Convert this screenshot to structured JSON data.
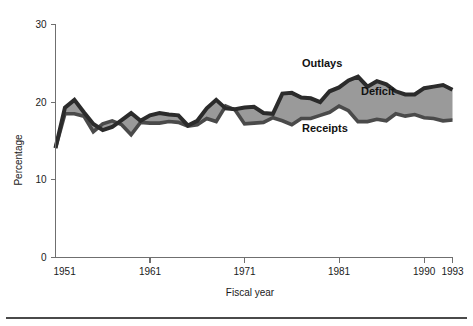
{
  "chart_data": {
    "type": "area",
    "title": "",
    "xlabel": "Fiscal year",
    "ylabel": "Percentage",
    "xlim": [
      1951,
      1993
    ],
    "ylim": [
      0,
      30
    ],
    "yticks": [
      0,
      10,
      20,
      30
    ],
    "ytick_labels": [
      "0",
      "10",
      "20",
      "30"
    ],
    "xticks": [
      1951,
      1961,
      1971,
      1981,
      1990,
      1993
    ],
    "xtick_labels": [
      "1951",
      "1961",
      "1971",
      "1981",
      "1990",
      "1993"
    ],
    "grid": false,
    "legend_position": "inline-annotations",
    "annotations": [
      {
        "text": "Outlays",
        "x": 1978,
        "y": 25.6
      },
      {
        "text": "Deficit",
        "x": 1984,
        "y": 22.0
      },
      {
        "text": "Receipts",
        "x": 1978,
        "y": 16.6
      }
    ],
    "colors": {
      "outlays_line": "#2b2b2b",
      "receipts_line": "#4a4a4a",
      "deficit_fill": "#9a9a9a",
      "axis": "#6f6f6f",
      "text": "#1a1a1a"
    },
    "x": [
      1951,
      1952,
      1953,
      1954,
      1955,
      1956,
      1957,
      1958,
      1959,
      1960,
      1961,
      1962,
      1963,
      1964,
      1965,
      1966,
      1967,
      1968,
      1969,
      1970,
      1971,
      1972,
      1973,
      1974,
      1975,
      1976,
      1977,
      1978,
      1979,
      1980,
      1981,
      1982,
      1983,
      1984,
      1985,
      1986,
      1987,
      1988,
      1989,
      1990,
      1991,
      1992,
      1993
    ],
    "series": [
      {
        "name": "Outlays",
        "values": [
          14.1,
          19.3,
          20.3,
          18.7,
          17.2,
          16.4,
          16.8,
          17.7,
          18.6,
          17.6,
          18.3,
          18.6,
          18.4,
          18.3,
          17.0,
          17.6,
          19.2,
          20.3,
          19.2,
          19.1,
          19.3,
          19.4,
          18.6,
          18.5,
          21.1,
          21.2,
          20.6,
          20.5,
          20.0,
          21.4,
          21.9,
          22.8,
          23.3,
          22.0,
          22.7,
          22.3,
          21.4,
          21.0,
          21.0,
          21.8,
          22.0,
          22.2,
          21.6
        ]
      },
      {
        "name": "Receipts",
        "values": [
          14.1,
          18.5,
          18.5,
          18.2,
          16.2,
          17.2,
          17.6,
          17.1,
          15.8,
          17.4,
          17.3,
          17.3,
          17.5,
          17.4,
          16.9,
          17.1,
          17.9,
          17.5,
          19.5,
          19.0,
          17.2,
          17.3,
          17.4,
          18.0,
          17.6,
          17.1,
          17.9,
          17.9,
          18.3,
          18.7,
          19.5,
          18.9,
          17.5,
          17.5,
          17.8,
          17.6,
          18.5,
          18.2,
          18.4,
          18.0,
          17.9,
          17.6,
          17.7
        ]
      }
    ]
  },
  "figure": {
    "percentage_label": "Percentage",
    "fiscal_year_label": "Fiscal year"
  }
}
